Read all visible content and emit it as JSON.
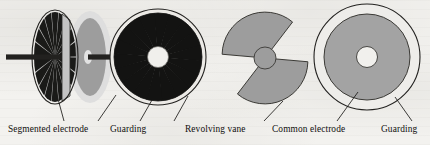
{
  "diagram": {
    "background_color": "#f3f2ef",
    "ink_color": "#100f0d",
    "grey_fill": "#9d9d9d",
    "light_grey_fill": "#d2d2d2",
    "pale_ring_fill": "#ebebeb",
    "white_fill": "#f2f2f0"
  },
  "figures": [
    {
      "id": "segmented-electrode-perspective",
      "name": "Segmented electrode (perspective / edge-on disc)",
      "center_x": 55,
      "center_y": 57,
      "segment_count": 18,
      "has_shaft": true
    },
    {
      "id": "guard-disc-perspective",
      "name": "Guarding disc (perspective / edge-on disc)",
      "center_x": 90,
      "center_y": 57,
      "has_shaft": true
    },
    {
      "id": "segmented-electrode-face",
      "name": "Segmented electrode face-on with guarding ring",
      "center_x": 158,
      "center_y": 57,
      "radius": 47,
      "segment_count": 18,
      "hub_radius": 10
    },
    {
      "id": "revolving-vane",
      "name": "Revolving vane (two opposed sectors)",
      "center_x": 265,
      "center_y": 58,
      "radius": 43,
      "hub_radius": 11,
      "blade_count": 2,
      "blade_sweep_deg": 100
    },
    {
      "id": "common-electrode-face",
      "name": "Common electrode face-on with guarding ring",
      "center_x": 367,
      "center_y": 57,
      "outer_radius": 53,
      "electrode_radius": 43,
      "hole_radius": 10
    }
  ],
  "labels": [
    {
      "id": "segmented-electrode",
      "text": "Segmented electrode",
      "x": 8,
      "y": 128
    },
    {
      "id": "guarding-left",
      "text": "Guarding",
      "x": 110,
      "y": 128
    },
    {
      "id": "revolving-vane",
      "text": "Revolving vane",
      "x": 185,
      "y": 128
    },
    {
      "id": "common-electrode",
      "text": "Common electrode",
      "x": 272,
      "y": 128
    },
    {
      "id": "guarding-right",
      "text": "Guarding",
      "x": 381,
      "y": 128
    }
  ],
  "leader_lines": [
    {
      "id": "leader-segmented-electrode",
      "from_x": 55,
      "from_y": 88,
      "to_x": 64,
      "to_y": 121
    },
    {
      "id": "leader-guarding-left-a",
      "from_x": 116,
      "from_y": 95,
      "to_x": 98,
      "to_y": 121
    },
    {
      "id": "leader-guarding-left-b",
      "from_x": 152,
      "from_y": 100,
      "to_x": 140,
      "to_y": 121
    },
    {
      "id": "leader-guarding-left-c",
      "from_x": 188,
      "from_y": 96,
      "to_x": 174,
      "to_y": 121
    },
    {
      "id": "leader-revolving-vane",
      "from_x": 283,
      "from_y": 101,
      "to_x": 264,
      "to_y": 121
    },
    {
      "id": "leader-common-electrode",
      "from_x": 358,
      "from_y": 92,
      "to_x": 337,
      "to_y": 121
    },
    {
      "id": "leader-guarding-right",
      "from_x": 395,
      "from_y": 97,
      "to_x": 412,
      "to_y": 121
    }
  ]
}
